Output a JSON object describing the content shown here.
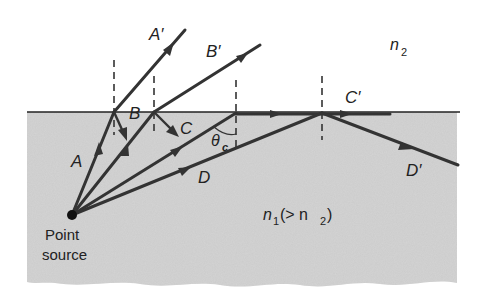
{
  "figure": {
    "colors": {
      "dense_medium": "#cbcbcb",
      "rare_medium": "#ffffff",
      "ray": "#333333"
    },
    "labels": {
      "ray_a": "A",
      "ray_a_refracted": "A′",
      "ray_b": "B",
      "ray_b_refracted": "B′",
      "ray_c": "C",
      "ray_c_grazing": "C′",
      "ray_d": "D",
      "ray_d_reflected": "D′",
      "critical_angle": "θ",
      "critical_angle_sub": "c",
      "medium_top_n": "n",
      "medium_top_sub": "2",
      "medium_bottom_n": "n",
      "medium_bottom_sub": "1",
      "medium_bottom_relation": " (> n",
      "medium_bottom_relation_sub": "2",
      "medium_bottom_close": ")",
      "source_line1": "Point",
      "source_line2": "source"
    }
  }
}
